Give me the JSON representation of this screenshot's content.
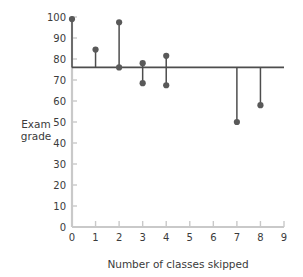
{
  "chart_data": {
    "type": "scatter",
    "title": "",
    "xlabel": "Number of classes skipped",
    "ylabel": "Exam grade",
    "xlim": [
      0,
      9
    ],
    "ylim": [
      0,
      100
    ],
    "xticks": [
      0,
      1,
      2,
      3,
      4,
      5,
      6,
      7,
      8,
      9
    ],
    "yticks": [
      0,
      10,
      20,
      30,
      40,
      50,
      60,
      70,
      80,
      90,
      100
    ],
    "xtick_labels": [
      "0",
      "1",
      "2",
      "3",
      "4",
      "5",
      "6",
      "7",
      "8",
      "9"
    ],
    "ytick_labels": [
      "0",
      "10",
      "20",
      "30",
      "40",
      "50",
      "60",
      "70",
      "80",
      "90",
      "100"
    ],
    "grid": false,
    "legend": null,
    "reference_line": {
      "orientation": "horizontal",
      "y": 76,
      "label": "",
      "color": "#4d4d4d"
    },
    "points": [
      {
        "x": 0,
        "y": 99.0
      },
      {
        "x": 1,
        "y": 84.5
      },
      {
        "x": 2,
        "y": 97.5
      },
      {
        "x": 2,
        "y": 76.0
      },
      {
        "x": 3,
        "y": 78.0
      },
      {
        "x": 3,
        "y": 68.5
      },
      {
        "x": 4,
        "y": 81.5
      },
      {
        "x": 4,
        "y": 67.5
      },
      {
        "x": 7,
        "y": 50.0
      },
      {
        "x": 8,
        "y": 58.0
      }
    ],
    "residual_lines": [
      {
        "x": 0,
        "y_point": 99.0,
        "y_line": 76
      },
      {
        "x": 1,
        "y_point": 84.5,
        "y_line": 76
      },
      {
        "x": 2,
        "y_point": 97.5,
        "y_line": 76
      },
      {
        "x": 2,
        "y_point": 76.0,
        "y_line": 76
      },
      {
        "x": 3,
        "y_point": 78.0,
        "y_line": 76
      },
      {
        "x": 3,
        "y_point": 68.5,
        "y_line": 76
      },
      {
        "x": 4,
        "y_point": 81.5,
        "y_line": 76
      },
      {
        "x": 4,
        "y_point": 67.5,
        "y_line": 76
      },
      {
        "x": 7,
        "y_point": 50.0,
        "y_line": 76
      },
      {
        "x": 8,
        "y_point": 58.0,
        "y_line": 76
      }
    ],
    "colors": {
      "point": "#595959",
      "residual": "#4d4d4d",
      "reference_line": "#3f3f3f",
      "axis": "#c9c9c9",
      "text": "#3b3b3b",
      "background": "#ffffff"
    }
  },
  "axes": {
    "y_title_line1": "Exam",
    "y_title_line2": "grade",
    "x_title": "Number of classes skipped"
  }
}
